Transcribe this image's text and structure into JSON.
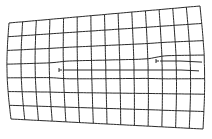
{
  "diagram": {
    "title": "Distorted lattice grid with two edge dislocations",
    "stroke_color": "#2a2a2a",
    "background": "#ffffff",
    "grid": {
      "columns": 14,
      "rows": 7,
      "corners": {
        "top_left": [
          9,
          23
        ],
        "top_right": [
          200,
          6
        ],
        "bottom_left": [
          11,
          119
        ],
        "bottom_right": [
          203,
          129
        ]
      },
      "left_edge_bow": -3,
      "right_edge_bow": 3
    },
    "dislocations": [
      {
        "name": "dislocation-left",
        "symbol": "⊢",
        "x": 59,
        "y": 70,
        "extra_line_to_x": 200
      },
      {
        "name": "dislocation-right",
        "symbol": "⊢",
        "x": 156,
        "y": 61,
        "extra_line_to_x": 202
      }
    ]
  }
}
